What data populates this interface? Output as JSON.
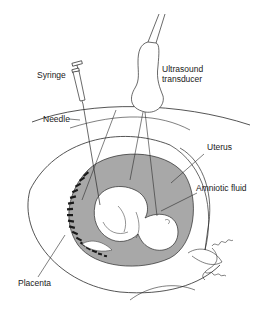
{
  "diagram": {
    "type": "anatomical illustration",
    "labels": {
      "syringe": "Syringe",
      "needle": "Needle",
      "transducer_line1": "Ultrasound",
      "transducer_line2": "transducer",
      "uterus": "Uterus",
      "amniotic_fluid": "Amniotic fluid",
      "placenta": "Placenta"
    },
    "colors": {
      "line": "#2a2a2a",
      "amniotic_fluid_fill": "#a8a8a8",
      "placenta_fill": "#1a1a1a",
      "background": "#ffffff",
      "text": "#1a1a1a"
    }
  }
}
